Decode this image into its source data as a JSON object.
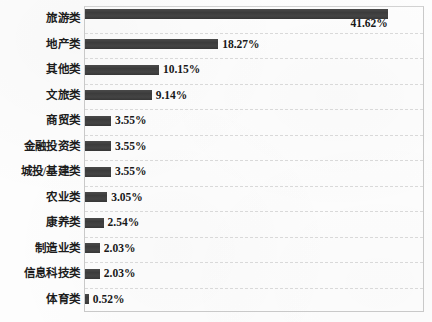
{
  "chart_data": {
    "type": "bar",
    "orientation": "horizontal",
    "title": "",
    "subtitle": "",
    "xlabel": "",
    "ylabel": "",
    "grid": true,
    "legend": null,
    "xlim": [
      0,
      46.5
    ],
    "value_suffix": "%",
    "bar_color": "#414141",
    "gridline_color": "#d9d9d9",
    "plot_border_color": "#c9c9c9",
    "categories": [
      "旅游类",
      "地产类",
      "其他类",
      "文旅类",
      "商贸类",
      "金融投资类",
      "城投/基建类",
      "农业类",
      "康养类",
      "制造业类",
      "信息科技类",
      "体育类"
    ],
    "values": [
      41.62,
      18.27,
      10.15,
      9.14,
      3.55,
      3.55,
      3.55,
      3.05,
      2.54,
      2.03,
      2.03,
      0.52
    ],
    "labels": [
      "41.62%",
      "18.27%",
      "10.15%",
      "9.14%",
      "3.55%",
      "3.55%",
      "3.55%",
      "3.05%",
      "2.54%",
      "2.03%",
      "2.03%",
      "0.52%"
    ]
  }
}
